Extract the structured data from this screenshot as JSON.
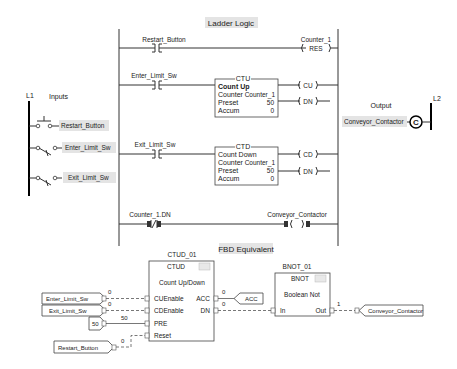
{
  "ladder": {
    "title": "Ladder Logic",
    "rungs": [
      {
        "contact": "Restart_Button",
        "coil_tag": "Counter_1",
        "coil": "RES"
      },
      {
        "contact": "Enter_Limit_Sw",
        "block": {
          "type": "CTU",
          "name": "Count Up",
          "counter_label": "Counter",
          "counter": "Counter_1",
          "preset_label": "Preset",
          "preset": "50",
          "accum_label": "Accum",
          "accum": "0"
        },
        "outputs": [
          "CU",
          "DN"
        ]
      },
      {
        "contact": "Exit_Limit_Sw",
        "block": {
          "type": "CTD",
          "name": "Count Down",
          "counter_label": "Counter",
          "counter": "Counter_1",
          "preset_label": "Preset",
          "preset": "50",
          "accum_label": "Accum",
          "accum": "0"
        },
        "outputs": [
          "CD",
          "DN"
        ]
      },
      {
        "contact": "Counter_1.DN",
        "coil_tag": "Conveyor_Contactor"
      }
    ]
  },
  "inputs": {
    "rail": "L1",
    "title": "Inputs",
    "items": [
      "Restart_Button",
      "Enter_Limit_Sw",
      "Exit_Limit_Sw"
    ]
  },
  "output": {
    "rail": "L2",
    "title": "Output",
    "tag": "Conveyor_Contactor",
    "coil_symbol": "C"
  },
  "fbd": {
    "title": "FBD Equivalent",
    "ctud": {
      "instance": "CTUD_01",
      "type": "CTUD",
      "description": "Count Up/Down",
      "inputs": [
        "CUEnable",
        "CDEnable",
        "PRE",
        "Reset"
      ],
      "outputs": [
        "ACC",
        "DN"
      ]
    },
    "bnot": {
      "instance": "BNOT_01",
      "type": "BNOT",
      "description": "Boolean Not",
      "input": "In",
      "output": "Out"
    },
    "input_refs": [
      "Enter_Limit_Sw",
      "Exit_Limit_Sw",
      "Restart_Button"
    ],
    "constant": "50",
    "output_refs": [
      "ACC",
      "Conveyor_Contactor"
    ],
    "wire_values": {
      "cuenable": "0",
      "cdenable": "0",
      "pre": "50",
      "reset": "0",
      "acc": "0",
      "dn": "0",
      "out": "1"
    }
  }
}
